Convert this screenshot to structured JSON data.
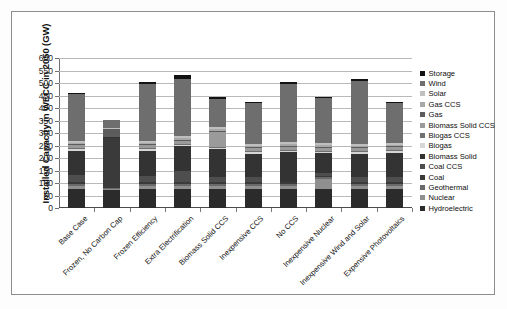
{
  "chart_data": {
    "type": "bar",
    "stacked": true,
    "title": "",
    "xlabel": "",
    "ylabel": "Installed Capacity in WECC in 2050 (GW)",
    "ylim": [
      0,
      600
    ],
    "ytick_step": 50,
    "yticks": [
      0,
      50,
      100,
      150,
      200,
      250,
      300,
      350,
      400,
      450,
      500,
      550,
      600
    ],
    "grid": true,
    "legend_position": "right",
    "categories": [
      "Base Case",
      "Frozen, No Carbon Cap",
      "Frozen Efficiency",
      "Extra Electrification",
      "Biomass Solid CCS",
      "Inexpensive CCS",
      "No CCS",
      "Inexpensive Nuclear",
      "Inexpensive Wind and Solar",
      "Expensive Photovoltaics"
    ],
    "totals": [
      462,
      353,
      503,
      523,
      438,
      422,
      503,
      443,
      515,
      422
    ],
    "series": [
      {
        "name": "Hydroelectric",
        "color": "#2b2b2b",
        "values": [
          75,
          75,
          75,
          75,
          75,
          75,
          75,
          75,
          75,
          75
        ]
      },
      {
        "name": "Nuclear",
        "color": "#8f8f8f",
        "values": [
          13,
          3,
          13,
          13,
          13,
          13,
          13,
          40,
          13,
          13
        ]
      },
      {
        "name": "Geothermal",
        "color": "#6a6a6a",
        "values": [
          10,
          4,
          10,
          10,
          10,
          10,
          10,
          10,
          10,
          10
        ]
      },
      {
        "name": "Coal",
        "color": "#3a3a3a",
        "values": [
          5,
          200,
          5,
          5,
          5,
          5,
          5,
          5,
          5,
          5
        ]
      },
      {
        "name": "Coal CCS",
        "color": "#4e4e4e",
        "values": [
          30,
          0,
          25,
          45,
          20,
          20,
          0,
          10,
          20,
          22
        ]
      },
      {
        "name": "Biomass Solid",
        "color": "#333333",
        "values": [
          97,
          2,
          102,
          100,
          112,
          95,
          120,
          80,
          95,
          97
        ]
      },
      {
        "name": "Biogas",
        "color": "#d6d6d6",
        "values": [
          6,
          2,
          6,
          6,
          6,
          6,
          6,
          6,
          6,
          6
        ]
      },
      {
        "name": "Biogas CCS",
        "color": "#707070",
        "values": [
          4,
          0,
          4,
          4,
          4,
          4,
          4,
          4,
          4,
          4
        ]
      },
      {
        "name": "Biomass Solid CCS",
        "color": "#9a9a9a",
        "values": [
          12,
          0,
          12,
          12,
          60,
          12,
          12,
          12,
          12,
          12
        ]
      },
      {
        "name": "Gas",
        "color": "#5c5c5c",
        "values": [
          4,
          30,
          4,
          4,
          4,
          4,
          4,
          4,
          4,
          4
        ]
      },
      {
        "name": "Gas CCS",
        "color": "#a8a8a8",
        "values": [
          6,
          0,
          6,
          6,
          6,
          6,
          6,
          6,
          6,
          6
        ]
      },
      {
        "name": "Solar",
        "color": "#bfbfbf",
        "values": [
          8,
          3,
          8,
          8,
          8,
          8,
          8,
          8,
          8,
          8
        ]
      },
      {
        "name": "Wind",
        "color": "#6e6e6e",
        "values": [
          185,
          34,
          226,
          229,
          113,
          162,
          232,
          181,
          249,
          158
        ]
      },
      {
        "name": "Storage",
        "color": "#121212",
        "values": [
          7,
          0,
          7,
          16,
          7,
          2,
          8,
          2,
          8,
          2
        ]
      }
    ]
  },
  "legend": {
    "items": [
      {
        "label": "Storage",
        "color": "#121212"
      },
      {
        "label": "Wind",
        "color": "#6e6e6e"
      },
      {
        "label": "Solar",
        "color": "#bfbfbf"
      },
      {
        "label": "Gas CCS",
        "color": "#a8a8a8"
      },
      {
        "label": "Gas",
        "color": "#5c5c5c"
      },
      {
        "label": "Biomass Solid CCS",
        "color": "#9a9a9a"
      },
      {
        "label": "Biogas CCS",
        "color": "#707070"
      },
      {
        "label": "Biogas",
        "color": "#d6d6d6"
      },
      {
        "label": "Biomass Solid",
        "color": "#333333"
      },
      {
        "label": "Coal CCS",
        "color": "#4e4e4e"
      },
      {
        "label": "Coal",
        "color": "#3a3a3a"
      },
      {
        "label": "Geothermal",
        "color": "#6a6a6a"
      },
      {
        "label": "Nuclear",
        "color": "#8f8f8f"
      },
      {
        "label": "Hydroelectric",
        "color": "#2b2b2b"
      }
    ]
  }
}
